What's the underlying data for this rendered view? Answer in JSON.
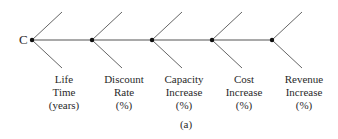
{
  "diagram": {
    "type": "cause-and-effect chain",
    "root": {
      "label": "C"
    },
    "colors": {
      "line": "#555555",
      "node": "#111111",
      "text": "#2a2a2a"
    },
    "nodes": [
      {
        "lines": [
          "Life",
          "Time",
          "(years)"
        ]
      },
      {
        "lines": [
          "Discount",
          "Rate",
          "(%)"
        ]
      },
      {
        "lines": [
          "Capacity",
          "Increase",
          "(%)"
        ]
      },
      {
        "lines": [
          "Cost",
          "Increase",
          "(%)"
        ]
      },
      {
        "lines": [
          "Revenue",
          "Increase",
          "(%)"
        ]
      }
    ],
    "caption": "(a)"
  }
}
